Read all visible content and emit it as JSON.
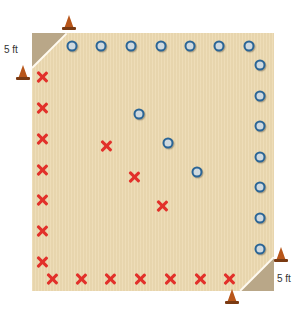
{
  "diagram": {
    "title": "",
    "court": {
      "color": "#ecd9b0",
      "corner_color": "#b9a788"
    },
    "labels": {
      "top_left_corner": "5 ft",
      "bottom_right_corner": "5 ft"
    },
    "o_markers": {
      "color": "#2b6596",
      "positions": [
        [
          72,
          46
        ],
        [
          101,
          46
        ],
        [
          131,
          46
        ],
        [
          161,
          46
        ],
        [
          190,
          46
        ],
        [
          219,
          46
        ],
        [
          249,
          46
        ],
        [
          260,
          65
        ],
        [
          260,
          96
        ],
        [
          260,
          126
        ],
        [
          260,
          157
        ],
        [
          260,
          187
        ],
        [
          260,
          218
        ],
        [
          260,
          249
        ],
        [
          139,
          114
        ],
        [
          168,
          143
        ],
        [
          197,
          172
        ]
      ]
    },
    "x_markers": {
      "color": "#e2302a",
      "positions": [
        [
          42,
          77
        ],
        [
          42,
          108
        ],
        [
          42,
          139
        ],
        [
          42,
          170
        ],
        [
          42,
          200
        ],
        [
          42,
          231
        ],
        [
          42,
          262
        ],
        [
          52,
          279
        ],
        [
          81,
          279
        ],
        [
          110,
          279
        ],
        [
          140,
          279
        ],
        [
          170,
          279
        ],
        [
          200,
          279
        ],
        [
          229,
          279
        ],
        [
          106,
          146
        ],
        [
          134,
          177
        ],
        [
          162,
          206
        ]
      ]
    },
    "cones": {
      "color": "#b8561a",
      "positions": [
        [
          69,
          22
        ],
        [
          23,
          72
        ],
        [
          281,
          254
        ],
        [
          232,
          296
        ]
      ]
    }
  }
}
